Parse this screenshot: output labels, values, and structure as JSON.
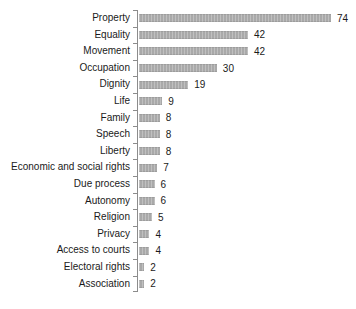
{
  "chart_data": {
    "type": "bar",
    "orientation": "horizontal",
    "title": "",
    "xlabel": "",
    "ylabel": "",
    "xlim": [
      0,
      80
    ],
    "grid": false,
    "legend": false,
    "value_labels_shown": true,
    "categories": [
      "Property",
      "Equality",
      "Movement",
      "Occupation",
      "Dignity",
      "Life",
      "Family",
      "Speech",
      "Liberty",
      "Economic and social rights",
      "Due process",
      "Autonomy",
      "Religion",
      "Privacy",
      "Access to courts",
      "Electoral rights",
      "Association"
    ],
    "values": [
      74,
      42,
      42,
      30,
      19,
      9,
      8,
      8,
      8,
      7,
      6,
      6,
      5,
      4,
      4,
      2,
      2
    ],
    "colors": {
      "bar": "#b0b0b0",
      "axis": "#8c8c8c",
      "text": "#1a1a1a",
      "background": "#ffffff"
    }
  }
}
